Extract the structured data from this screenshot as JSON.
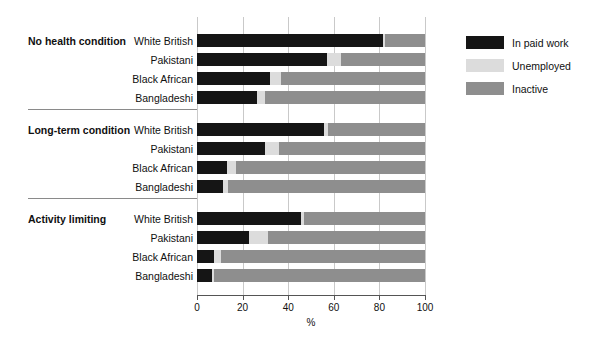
{
  "chart_data": {
    "type": "bar",
    "orientation": "horizontal",
    "stacked": true,
    "title": "",
    "xlabel": "%",
    "ylabel": "",
    "xlim": [
      0,
      100
    ],
    "xticks": [
      0,
      20,
      40,
      60,
      80,
      100
    ],
    "grid": true,
    "legend_position": "right",
    "series": [
      {
        "name": "In paid work",
        "color": "#151515"
      },
      {
        "name": "Unemployed",
        "color": "#dcdcdc"
      },
      {
        "name": "Inactive",
        "color": "#8e8e8e"
      }
    ],
    "groups": [
      {
        "label": "No health condition",
        "rows": [
          {
            "category": "White British",
            "values": [
              81.5,
              1.0,
              17.5
            ]
          },
          {
            "category": "Pakistani",
            "values": [
              57.0,
              6.0,
              37.0
            ]
          },
          {
            "category": "Black African",
            "values": [
              32.0,
              5.0,
              63.0
            ]
          },
          {
            "category": "Bangladeshi",
            "values": [
              26.5,
              3.5,
              70.0
            ]
          }
        ]
      },
      {
        "label": "Long-term condition",
        "rows": [
          {
            "category": "White British",
            "values": [
              55.5,
              2.0,
              42.5
            ]
          },
          {
            "category": "Pakistani",
            "values": [
              30.0,
              6.0,
              64.0
            ]
          },
          {
            "category": "Black African",
            "values": [
              13.0,
              4.0,
              83.0
            ]
          },
          {
            "category": "Bangladeshi",
            "values": [
              11.5,
              2.0,
              86.5
            ]
          }
        ]
      },
      {
        "label": "Activity limiting",
        "rows": [
          {
            "category": "White British",
            "values": [
              45.5,
              1.5,
              53.0
            ]
          },
          {
            "category": "Pakistani",
            "values": [
              23.0,
              8.0,
              69.0
            ]
          },
          {
            "category": "Black African",
            "values": [
              7.5,
              3.0,
              89.5
            ]
          },
          {
            "category": "Bangladeshi",
            "values": [
              6.5,
              1.0,
              92.5
            ]
          }
        ]
      }
    ]
  },
  "legend": {
    "items": [
      {
        "label": "In paid work",
        "color": "#151515"
      },
      {
        "label": "Unemployed",
        "color": "#dcdcdc"
      },
      {
        "label": "Inactive",
        "color": "#8e8e8e"
      }
    ]
  },
  "axis": {
    "x_title": "%",
    "tick_labels": [
      "0",
      "20",
      "40",
      "60",
      "80",
      "100"
    ]
  }
}
